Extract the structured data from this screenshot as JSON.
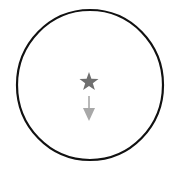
{
  "diagram": {
    "shapes": {
      "circle": {
        "cx": 90,
        "cy": 85,
        "rx": 73,
        "ry": 75,
        "stroke": "#111111",
        "stroke_width": 2.2,
        "fill": "#ffffff"
      },
      "star": {
        "cx": 89,
        "cy": 82,
        "outer_r": 10,
        "inner_r": 4,
        "color": "#6f6f6f",
        "label": "star"
      },
      "arrow": {
        "x": 89,
        "y1": 96,
        "y2": 121,
        "color": "#a8a8a8",
        "direction": "down",
        "label": "down arrow"
      }
    },
    "colors": {
      "background": "#ffffff",
      "outline": "#111111",
      "star": "#6f6f6f",
      "arrow": "#a8a8a8"
    }
  }
}
